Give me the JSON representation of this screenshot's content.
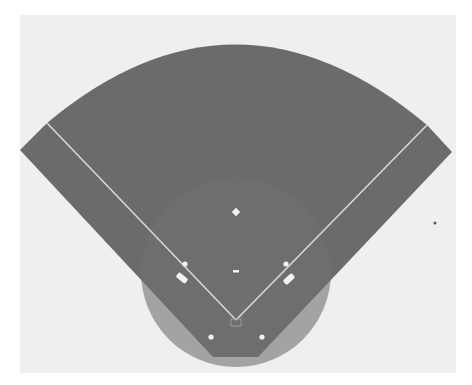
{
  "diagram": {
    "colors": {
      "page": "#ffffff",
      "panel": "#efefef",
      "field": "#6b6b6b",
      "infield_shade": "#707070",
      "lines": "#d8d8d8",
      "markers": "#f2f2f2",
      "stray_dot": "#555555"
    },
    "panel": {
      "x": 20,
      "y": 15,
      "w": 436,
      "h": 358
    },
    "field_outline": {
      "home": [
        236,
        320
      ],
      "left_line_end": [
        47,
        123
      ],
      "right_line_end": [
        427,
        125
      ],
      "left_corner": [
        20,
        150
      ],
      "right_corner": [
        452,
        152
      ],
      "bottom_left": [
        213,
        357
      ],
      "bottom_right": [
        258,
        357
      ],
      "arc_peak": [
        236,
        45
      ]
    },
    "infield_arc": {
      "cx": 236,
      "cy": 272,
      "r": 95
    },
    "markers": {
      "second_base": [
        236,
        212
      ],
      "pitcher_rubber": [
        236,
        271
      ],
      "first_base": [
        286,
        264
      ],
      "third_base": [
        185,
        264
      ],
      "left_coach_box": [
        182,
        278
      ],
      "right_coach_box": [
        289,
        279
      ],
      "left_lower_dot": [
        211,
        337
      ],
      "right_lower_dot": [
        262,
        337
      ],
      "home_plate": [
        236,
        322
      ],
      "stray_dot": [
        435,
        223
      ]
    }
  }
}
